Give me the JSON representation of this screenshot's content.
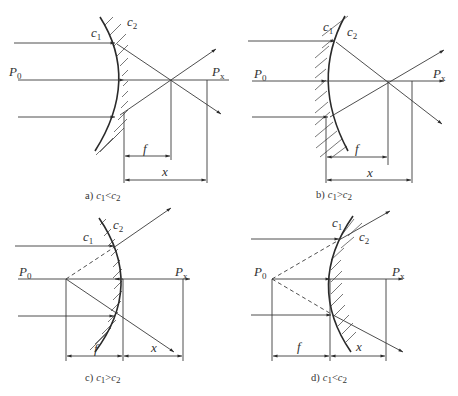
{
  "figure": {
    "panels": [
      {
        "id": "a",
        "caption_prefix": "a)",
        "condition": {
          "left": "c",
          "left_sub": "1",
          "op": "<",
          "right": "c",
          "right_sub": "2"
        },
        "labels": {
          "c1": "c",
          "c1_sub": "1",
          "c2": "c",
          "c2_sub": "2",
          "p0": "P",
          "p0_sub": "0",
          "px": "P",
          "px_sub": "x",
          "f": "f",
          "x": "x"
        }
      },
      {
        "id": "b",
        "caption_prefix": "b)",
        "condition": {
          "left": "c",
          "left_sub": "1",
          "op": ">",
          "right": "c",
          "right_sub": "2"
        },
        "labels": {
          "c1": "c",
          "c1_sub": "1",
          "c2": "c",
          "c2_sub": "2",
          "p0": "P",
          "p0_sub": "0",
          "px": "P",
          "px_sub": "x",
          "f": "f",
          "x": "x"
        }
      },
      {
        "id": "c",
        "caption_prefix": "c)",
        "condition": {
          "left": "c",
          "left_sub": "1",
          "op": ">",
          "right": "c",
          "right_sub": "2"
        },
        "labels": {
          "c1": "c",
          "c1_sub": "1",
          "c2": "c",
          "c2_sub": "2",
          "p0": "P",
          "p0_sub": "0",
          "px": "P",
          "px_sub": "x",
          "f": "f",
          "x": "x"
        }
      },
      {
        "id": "d",
        "caption_prefix": "d)",
        "condition": {
          "left": "c",
          "left_sub": "1",
          "op": "<",
          "right": "c",
          "right_sub": "2"
        },
        "labels": {
          "c1": "c",
          "c1_sub": "1",
          "c2": "c",
          "c2_sub": "2",
          "p0": "P",
          "p0_sub": "0",
          "px": "P",
          "px_sub": "x",
          "f": "f",
          "x": "x"
        }
      }
    ]
  }
}
